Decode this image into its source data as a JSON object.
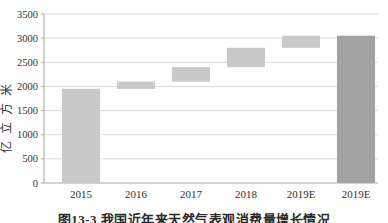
{
  "figure": {
    "caption": "图13-3 我国近年来天然气表观消费量增长情况"
  },
  "chart_data": {
    "type": "bar",
    "subtype": "waterfall",
    "title": "",
    "xlabel": "",
    "ylabel": "亿立方米",
    "categories": [
      "2015",
      "2016",
      "2017",
      "2018",
      "2019E",
      "2019E"
    ],
    "segments": [
      {
        "category": "2015",
        "from": 0,
        "to": 1950
      },
      {
        "category": "2016",
        "from": 1950,
        "to": 2100
      },
      {
        "category": "2017",
        "from": 2100,
        "to": 2400
      },
      {
        "category": "2018",
        "from": 2400,
        "to": 2800
      },
      {
        "category": "2019E",
        "from": 2800,
        "to": 3050
      },
      {
        "category": "2019E",
        "from": 0,
        "to": 3050
      }
    ],
    "cumulative_values": [
      1950,
      2100,
      2400,
      2800,
      3050,
      3050
    ],
    "ylim": [
      0,
      3500
    ],
    "yticks": [
      0,
      500,
      1000,
      1500,
      2000,
      2500,
      3000,
      3500
    ],
    "grid": true,
    "legend": false,
    "bar_fills": [
      "#c9c9c9",
      "#c9c9c9",
      "#c9c9c9",
      "#c9c9c9",
      "#c9c9c9",
      "#a2a2a2"
    ],
    "colors": {
      "bar_default": "#c9c9c9",
      "bar_total": "#a2a2a2",
      "gridline": "#dadada",
      "axis": "#a8a8a8",
      "text": "#333333"
    }
  }
}
